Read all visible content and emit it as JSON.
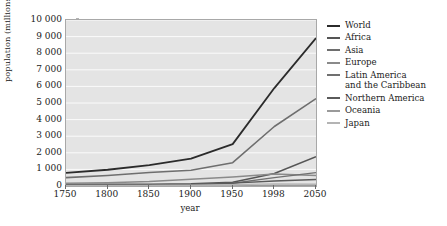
{
  "chart_data": {
    "type": "line",
    "title": "",
    "xlabel": "year",
    "ylabel": "population (millions)",
    "x": [
      1750,
      1800,
      1850,
      1900,
      1950,
      1998,
      2050
    ],
    "xtick_labels": [
      "1750",
      "1800",
      "1850",
      "1900",
      "1950",
      "1998",
      "2050"
    ],
    "xtick_spacing": "categorical-even",
    "ytick_labels": [
      "0",
      "1 000",
      "2 000",
      "3 000",
      "4 000",
      "5 000",
      "6 000",
      "7 000",
      "8 000",
      "9 000",
      "10 000"
    ],
    "ytick_values": [
      0,
      1000,
      2000,
      3000,
      4000,
      5000,
      6000,
      7000,
      8000,
      9000,
      10000
    ],
    "ylim": [
      0,
      10000
    ],
    "grid": "horizontal-white",
    "legend_position": "right-outside",
    "plot_background": "#e4e4e4",
    "series": [
      {
        "name": "World",
        "color": "#2b2b2b",
        "width": 1.8,
        "values": [
          791,
          978,
          1262,
          1650,
          2521,
          5900,
          8909
        ]
      },
      {
        "name": "Africa",
        "color": "#555555",
        "width": 1.5,
        "values": [
          106,
          107,
          111,
          133,
          221,
          749,
          1766
        ]
      },
      {
        "name": "Asia",
        "color": "#6e6e6e",
        "width": 1.6,
        "values": [
          502,
          635,
          809,
          947,
          1402,
          3585,
          5268
        ]
      },
      {
        "name": "Europe",
        "color": "#8a8a8a",
        "width": 1.5,
        "values": [
          163,
          203,
          276,
          408,
          547,
          729,
          628
        ]
      },
      {
        "name": "Latin America\nand the Caribbean",
        "color": "#707070",
        "width": 1.4,
        "values": [
          16,
          24,
          38,
          74,
          167,
          504,
          809
        ]
      },
      {
        "name": "Northern America",
        "color": "#5a5a5a",
        "width": 1.4,
        "values": [
          2,
          7,
          26,
          82,
          172,
          305,
          392
        ]
      },
      {
        "name": "Oceania",
        "color": "#9a9a9a",
        "width": 1.3,
        "values": [
          2,
          2,
          2,
          6,
          13,
          30,
          46
        ]
      },
      {
        "name": "Japan",
        "color": "#b4b4b4",
        "width": 1.3,
        "values": [
          30,
          30,
          32,
          44,
          84,
          126,
          105
        ]
      }
    ]
  },
  "legend": {
    "items": [
      {
        "label": "World",
        "color": "#2b2b2b"
      },
      {
        "label": "Africa",
        "color": "#555555"
      },
      {
        "label": "Asia",
        "color": "#6e6e6e"
      },
      {
        "label": "Europe",
        "color": "#8a8a8a"
      },
      {
        "label": "Latin America\nand the Caribbean",
        "color": "#707070"
      },
      {
        "label": "Northern America",
        "color": "#5a5a5a"
      },
      {
        "label": "Oceania",
        "color": "#9a9a9a"
      },
      {
        "label": "Japan",
        "color": "#b4b4b4"
      }
    ]
  },
  "axes": {
    "x_title": "year",
    "y_title": "population (millions)"
  }
}
